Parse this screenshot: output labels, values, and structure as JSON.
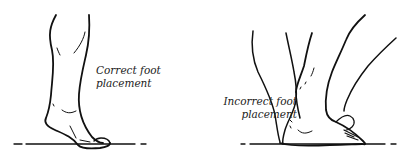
{
  "figure": {
    "panels": [
      {
        "id": "correct",
        "caption_line1": "Correct foot",
        "caption_line2": "placement"
      },
      {
        "id": "incorrect",
        "caption_line1": "Incorrect foot",
        "caption_line2": "placement"
      }
    ],
    "colors": {
      "line": "#111111",
      "background": "#ffffff"
    }
  }
}
